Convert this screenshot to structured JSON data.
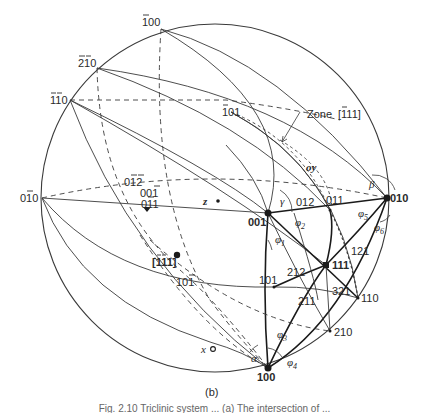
{
  "figure": {
    "panel_label": "(b)",
    "caption_partial": "Fig. 2.10  Triclinic system ... (a) The intersection of ... "
  },
  "colors": {
    "line": "#3a3a3a",
    "ink": "#222222",
    "background": "#ffffff"
  },
  "poles": {
    "p_100": "100",
    "p_010": "010",
    "p_001": "001",
    "p_111": "111",
    "p_101": "101",
    "p_011": "011",
    "p_110": "110",
    "p_210": "210",
    "p_012": "012",
    "p_212": "212",
    "p_211": "211",
    "p_121": "121",
    "p_321": "321",
    "p_bar100": "100",
    "p_bar2bar10": "210",
    "p_bar1bar10": "110",
    "p_0bar10": "010",
    "p_bar101": "101",
    "p_0bar1bar2": "012",
    "p_00bar1": "001",
    "p_0bar11": "011",
    "p_10bar1": "101",
    "zone_axis": "[111]"
  },
  "annotations": {
    "zone_label": "Zone [1̅1̅]",
    "zone_label_text": "Zone",
    "zone_indices": "[111]",
    "oy": "oy",
    "z": "z",
    "x": "x",
    "alpha": "α",
    "beta": "β",
    "gamma": "γ",
    "phi1": "φ",
    "phi1_sub": "1",
    "phi2": "φ",
    "phi2_sub": "2",
    "phi3": "φ",
    "phi3_sub": "3",
    "phi4": "φ",
    "phi4_sub": "4",
    "phi5": "φ",
    "phi5_sub": "5",
    "phi6": "φ",
    "phi6_sub": "6"
  }
}
